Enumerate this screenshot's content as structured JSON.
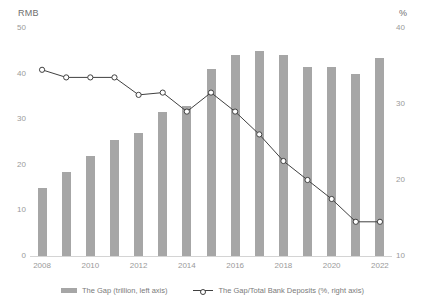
{
  "chart_data": {
    "type": "bar",
    "title": "",
    "xlabel": "",
    "ylabel": "RMB",
    "y2label": "%",
    "categories": [
      "2008",
      "2009",
      "2010",
      "2011",
      "2012",
      "2013",
      "2014",
      "2015",
      "2016",
      "2017",
      "2018",
      "2019",
      "2020",
      "2021",
      "2022"
    ],
    "x_tick_labels": [
      "2008",
      "2010",
      "2012",
      "2014",
      "2016",
      "2018",
      "2020",
      "2022"
    ],
    "y_tick_labels": [
      "50",
      "40",
      "30",
      "20",
      "10",
      "0"
    ],
    "y2_tick_labels": [
      "40",
      "30",
      "20",
      "10"
    ],
    "ylim": [
      0,
      50
    ],
    "y2lim": [
      10,
      40
    ],
    "grid": false,
    "legend_position": "bottom",
    "series": [
      {
        "name": "The Gap (trillion, left axis)",
        "type": "bar",
        "axis": "left",
        "color": "#a6a6a6",
        "values": [
          15,
          18.5,
          22,
          25.5,
          27,
          31.5,
          33,
          41,
          44,
          45,
          44,
          41.5,
          41.5,
          40,
          43.5
        ]
      },
      {
        "name": "The Gap/Total Bank Deposits (%, right axis)",
        "type": "line",
        "axis": "right",
        "color": "#404040",
        "values": [
          34.5,
          33.5,
          33.5,
          33.5,
          31.2,
          31.5,
          29.0,
          31.5,
          29.0,
          26.0,
          22.5,
          20.0,
          17.5,
          14.5,
          14.5
        ]
      }
    ]
  },
  "axes": {
    "left_unit": "RMB",
    "right_unit": "%"
  },
  "legend": {
    "items": [
      {
        "label": "The Gap (trillion, left axis)",
        "marker": "bar-swatch"
      },
      {
        "label": "The Gap/Total Bank Deposits (%, right axis)",
        "marker": "line-marker-swatch"
      }
    ]
  }
}
